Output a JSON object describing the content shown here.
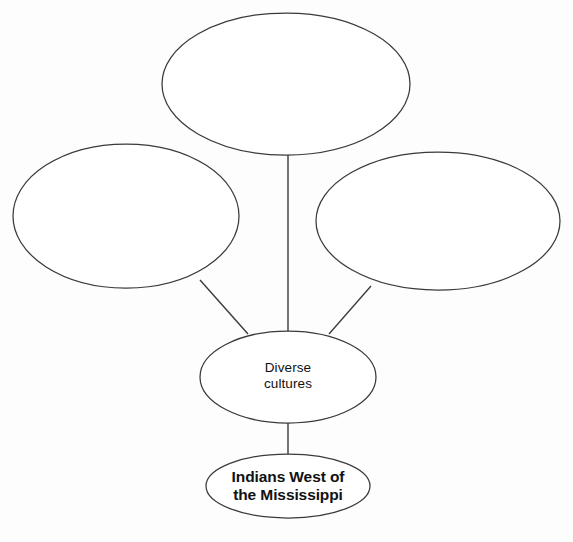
{
  "diagram": {
    "type": "concept-web",
    "background_color": "#fdfdfd",
    "stroke_color": "#3a3a3c",
    "text_color": "#111111",
    "nodes": [
      {
        "id": "blank-top",
        "label": "",
        "filled": false,
        "cx": 286,
        "cy": 84,
        "rx": 124,
        "ry": 71
      },
      {
        "id": "blank-left",
        "label": "",
        "filled": false,
        "cx": 126,
        "cy": 216,
        "rx": 113,
        "ry": 72
      },
      {
        "id": "blank-right",
        "label": "",
        "filled": false,
        "cx": 438,
        "cy": 221,
        "rx": 122,
        "ry": 69
      },
      {
        "id": "diverse-cultures",
        "label": "Diverse\ncultures",
        "filled": true,
        "cx": 288,
        "cy": 377,
        "rx": 88,
        "ry": 46
      },
      {
        "id": "root-topic",
        "label": "Indians West of\nthe Mississippi",
        "filled": true,
        "cx": 288,
        "cy": 486,
        "rx": 82,
        "ry": 32
      }
    ],
    "connectors": [
      {
        "id": "top-to-center",
        "from": "blank-top",
        "to": "diverse-cultures"
      },
      {
        "id": "left-to-center",
        "from": "blank-left",
        "to": "diverse-cultures"
      },
      {
        "id": "right-to-center",
        "from": "blank-right",
        "to": "diverse-cultures"
      },
      {
        "id": "center-to-root",
        "from": "diverse-cultures",
        "to": "root-topic"
      }
    ]
  },
  "labels": {
    "diverse_cultures": "Diverse\ncultures",
    "root_topic": "Indians West of\nthe Mississippi",
    "blank_top": "",
    "blank_left": "",
    "blank_right": ""
  }
}
